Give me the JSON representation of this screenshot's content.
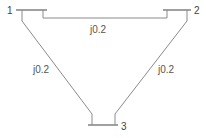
{
  "diagram": {
    "type": "three-bus power network",
    "buses": [
      {
        "id": "1",
        "label": "1"
      },
      {
        "id": "2",
        "label": "2"
      },
      {
        "id": "3",
        "label": "3"
      }
    ],
    "lines": [
      {
        "from": "1",
        "to": "2",
        "impedance": "j0.2"
      },
      {
        "from": "1",
        "to": "3",
        "impedance": "j0.2"
      },
      {
        "from": "2",
        "to": "3",
        "impedance": "j0.2"
      }
    ],
    "colors": {
      "line": "#8a8a8a",
      "bus": "#777777",
      "text": "#444444"
    }
  }
}
